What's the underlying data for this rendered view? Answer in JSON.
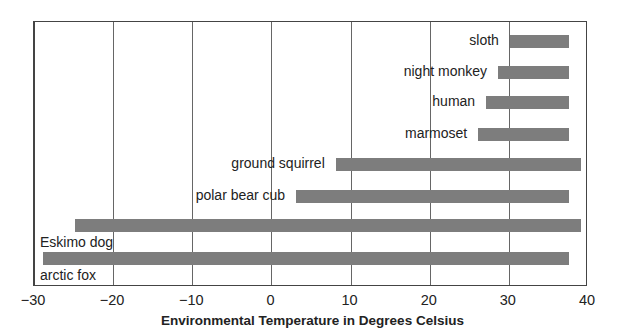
{
  "chart_data": {
    "type": "bar",
    "orientation": "horizontal",
    "title": "",
    "xlabel": "Environmental Temperature in Degrees Celsius",
    "ylabel": "",
    "xlim": [
      -30,
      40
    ],
    "xticks": [
      -30,
      -20,
      -10,
      0,
      10,
      20,
      30,
      40
    ],
    "xtick_labels": [
      "−30",
      "−20",
      "−10",
      "0",
      "10",
      "20",
      "30",
      "40"
    ],
    "grid": "vertical",
    "legend": null,
    "bar_color": "#7d7d7d",
    "series": [
      {
        "name": "sloth",
        "min": 30,
        "max": 37.5
      },
      {
        "name": "night monkey",
        "min": 28.5,
        "max": 37.5
      },
      {
        "name": "human",
        "min": 27,
        "max": 37.5
      },
      {
        "name": "marmoset",
        "min": 26,
        "max": 37.5
      },
      {
        "name": "ground squirrel",
        "min": 8,
        "max": 39
      },
      {
        "name": "polar bear cub",
        "min": 3,
        "max": 37.5
      },
      {
        "name": "Eskimo dog",
        "min": -25,
        "max": 39
      },
      {
        "name": "arctic fox",
        "min": -29,
        "max": 37.5
      }
    ]
  }
}
